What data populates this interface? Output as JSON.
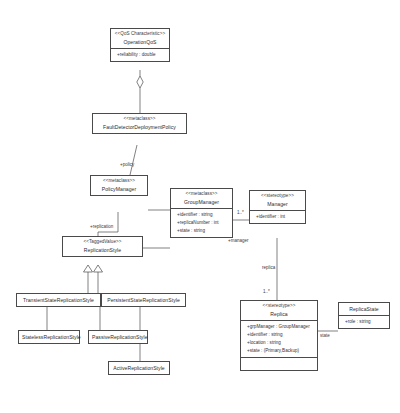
{
  "diagram": {
    "kind": "uml-class-diagram",
    "width": 400,
    "height": 413,
    "background": "#ffffff",
    "line_color": "#4a4a4a",
    "text_color": "#2b2b2b"
  },
  "classes": {
    "operation_qos": {
      "stereotype": "<<QoS Characteristic>>",
      "name": "OperationQoS",
      "attributes": [
        "+reliability : double"
      ]
    },
    "fault_detector_policy": {
      "stereotype": "<<metaclass>>",
      "name": "FaultDetectorDeploymentPolicy",
      "attributes": []
    },
    "policy_manager": {
      "stereotype": "<<metaclass>>",
      "name": "PolicyManager",
      "attributes": []
    },
    "group_manager": {
      "stereotype": "<<metaclass>>",
      "name": "GroupManager",
      "attributes": [
        "+identifier : string",
        "+replicaNumber : int",
        "+state : string"
      ]
    },
    "manager": {
      "stereotype": "<<stereotype>>",
      "name": "Manager",
      "attributes": [
        "+identifier : int"
      ]
    },
    "replica": {
      "stereotype": "<<stereotype>>",
      "name": "Replica",
      "attributes": [
        "+grpManager : GroupManager",
        "+identifier : string",
        "+location : string",
        "+state : (Primary,Backup)"
      ]
    },
    "replica_state": {
      "stereotype": "",
      "name": "ReplicaState",
      "attributes": [
        "+role : string"
      ]
    },
    "replication_style": {
      "stereotype": "<<TaggedValue>>",
      "name": "ReplicationStyle",
      "attributes": []
    },
    "transient_state": {
      "stereotype": "",
      "name": "TransientStateReplicationStyle",
      "attributes": []
    },
    "persistent_state": {
      "stereotype": "",
      "name": "PersistentStateReplicationStyle",
      "attributes": []
    },
    "stateless_style": {
      "stereotype": "",
      "name": "StatelessReplicationStyle",
      "attributes": []
    },
    "passive_style": {
      "stereotype": "",
      "name": "PassiveReplicationStyle",
      "attributes": []
    },
    "active_style": {
      "stereotype": "",
      "name": "ActiveReplicationStyle",
      "attributes": []
    }
  },
  "edge_labels": {
    "policy": "+policy",
    "replication": "+replication",
    "manager_role": "+manager",
    "gm_manager_mult": "1..*",
    "replica_role": "replica",
    "replica_mult": "1..*",
    "state_role": "state"
  },
  "relationships": [
    {
      "from": "operation_qos",
      "to": "fault_detector_policy",
      "type": "aggregation"
    },
    {
      "from": "fault_detector_policy",
      "to": "policy_manager",
      "type": "association",
      "label": "+policy"
    },
    {
      "from": "policy_manager",
      "to": "group_manager",
      "type": "association"
    },
    {
      "from": "policy_manager",
      "to": "replication_style",
      "type": "association",
      "label": "+replication"
    },
    {
      "from": "group_manager",
      "to": "manager",
      "type": "association",
      "label": "1..*"
    },
    {
      "from": "manager",
      "to": "replica",
      "type": "association",
      "label": "replica",
      "multiplicity": "1..*"
    },
    {
      "from": "replica",
      "to": "replica_state",
      "type": "association",
      "label": "state"
    },
    {
      "from": "transient_state",
      "to": "replication_style",
      "type": "generalization"
    },
    {
      "from": "persistent_state",
      "to": "replication_style",
      "type": "generalization"
    },
    {
      "from": "stateless_style",
      "to": "transient_state",
      "type": "generalization"
    },
    {
      "from": "passive_style",
      "to": "persistent_state",
      "type": "generalization"
    },
    {
      "from": "active_style",
      "to": "persistent_state",
      "type": "generalization"
    }
  ]
}
